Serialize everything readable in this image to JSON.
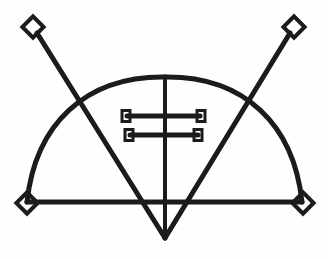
{
  "artwork": {
    "title": "Goetic Seal Sigil",
    "kind": "line-drawing",
    "background_color": "#fefefe",
    "ink_color": "#1c1b1a",
    "canvas": {
      "width": 328,
      "height": 259
    }
  },
  "geometry": {
    "baseline": {
      "label": "horizontal base line",
      "x1": 27,
      "y1": 202,
      "x2": 302,
      "y2": 202,
      "stroke_width": 5
    },
    "arc": {
      "label": "semicircular dome arc",
      "left_x": 27,
      "left_y": 202,
      "apex_x": 165,
      "apex_y": 77,
      "right_x": 302,
      "right_y": 202,
      "stroke_width": 5
    },
    "vertical": {
      "label": "central vertical stem",
      "x1": 165,
      "y1": 77,
      "x2": 165,
      "y2": 238,
      "stroke_width": 4
    },
    "diagonals": [
      {
        "label": "left diagonal from upper-left node to lower apex",
        "x1": 37,
        "y1": 33,
        "x2": 165,
        "y2": 238,
        "stroke_width": 5
      },
      {
        "label": "right diagonal from upper-right node to lower apex",
        "x1": 290,
        "y1": 33,
        "x2": 165,
        "y2": 238,
        "stroke_width": 5
      }
    ],
    "diamond_nodes": [
      {
        "name": "top-left-diamond",
        "cx": 33,
        "cy": 27,
        "size": 15,
        "stroke_width": 4
      },
      {
        "name": "top-right-diamond",
        "cx": 294,
        "cy": 27,
        "size": 15,
        "stroke_width": 4
      },
      {
        "name": "bottom-left-diamond",
        "cx": 27,
        "cy": 203,
        "size": 15,
        "stroke_width": 4
      },
      {
        "name": "bottom-right-diamond",
        "cx": 303,
        "cy": 203,
        "size": 15,
        "stroke_width": 4
      }
    ],
    "ladder": {
      "label": "double crossbar ladder on central stem",
      "rungs": [
        {
          "name": "upper-rung",
          "x1": 127,
          "x2": 200,
          "y": 116,
          "stroke_width": 5
        },
        {
          "name": "lower-rung",
          "x1": 130,
          "x2": 198,
          "y": 135,
          "stroke_width": 5
        }
      ],
      "terminals": [
        {
          "name": "upper-left-terminal",
          "cx": 126,
          "cy": 116,
          "w": 8,
          "h": 11,
          "stroke_width": 3
        },
        {
          "name": "upper-right-terminal",
          "cx": 201,
          "cy": 116,
          "w": 8,
          "h": 11,
          "stroke_width": 3
        },
        {
          "name": "lower-left-terminal",
          "cx": 129,
          "cy": 135,
          "w": 8,
          "h": 11,
          "stroke_width": 3
        },
        {
          "name": "lower-right-terminal",
          "cx": 198,
          "cy": 135,
          "w": 8,
          "h": 11,
          "stroke_width": 3
        }
      ]
    }
  }
}
